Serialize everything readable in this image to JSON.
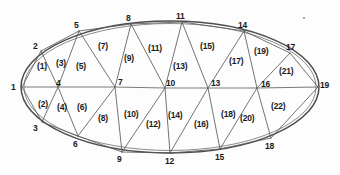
{
  "figure": {
    "type": "triangulated-ellipse-mesh",
    "caption": "",
    "stroke_color": "#5a5a5a",
    "background_color": "#fdfdfd",
    "canvas": {
      "width": 340,
      "height": 175
    }
  },
  "ellipse": {
    "center_x": 170,
    "center_y": 87,
    "radius_x": 149,
    "radius_y": 66
  },
  "nodes": [
    {
      "id": "1",
      "label": "1",
      "x": 22,
      "y": 87,
      "lx": 11,
      "ly": 83
    },
    {
      "id": "2",
      "label": "2",
      "x": 41,
      "y": 51,
      "lx": 33,
      "ly": 42
    },
    {
      "id": "3",
      "label": "3",
      "x": 42,
      "y": 122,
      "lx": 33,
      "ly": 124
    },
    {
      "id": "4",
      "label": "4",
      "x": 58,
      "y": 87,
      "lx": 56,
      "ly": 79
    },
    {
      "id": "5",
      "label": "5",
      "x": 79,
      "y": 31,
      "lx": 74,
      "ly": 21
    },
    {
      "id": "6",
      "label": "6",
      "x": 78,
      "y": 136,
      "lx": 73,
      "ly": 140
    },
    {
      "id": "7",
      "label": "7",
      "x": 115,
      "y": 87,
      "lx": 118,
      "ly": 78
    },
    {
      "id": "8",
      "label": "8",
      "x": 131,
      "y": 24,
      "lx": 126,
      "ly": 14
    },
    {
      "id": "9",
      "label": "9",
      "x": 122,
      "y": 152,
      "lx": 117,
      "ly": 155
    },
    {
      "id": "10",
      "label": "10",
      "x": 165,
      "y": 88,
      "lx": 166,
      "ly": 79
    },
    {
      "id": "11",
      "label": "11",
      "x": 182,
      "y": 22,
      "lx": 176,
      "ly": 12
    },
    {
      "id": "12",
      "label": "12",
      "x": 170,
      "y": 153,
      "lx": 165,
      "ly": 157
    },
    {
      "id": "13",
      "label": "13",
      "x": 208,
      "y": 88,
      "lx": 211,
      "ly": 79
    },
    {
      "id": "14",
      "label": "14",
      "x": 244,
      "y": 31,
      "lx": 238,
      "ly": 21
    },
    {
      "id": "15",
      "label": "15",
      "x": 220,
      "y": 149,
      "lx": 215,
      "ly": 153
    },
    {
      "id": "16",
      "label": "16",
      "x": 257,
      "y": 88,
      "lx": 261,
      "ly": 80
    },
    {
      "id": "17",
      "label": "17",
      "x": 290,
      "y": 53,
      "lx": 286,
      "ly": 43
    },
    {
      "id": "18",
      "label": "18",
      "x": 271,
      "y": 138,
      "lx": 265,
      "ly": 142
    },
    {
      "id": "19",
      "label": "19",
      "x": 318,
      "y": 87,
      "lx": 320,
      "ly": 81
    }
  ],
  "edges": [
    {
      "from": "1",
      "to": "2",
      "kind": "chord"
    },
    {
      "from": "1",
      "to": "3",
      "kind": "chord"
    },
    {
      "from": "1",
      "to": "4",
      "kind": "axis"
    },
    {
      "from": "2",
      "to": "4",
      "kind": "chord"
    },
    {
      "from": "3",
      "to": "4",
      "kind": "chord"
    },
    {
      "from": "2",
      "to": "5",
      "kind": "chord"
    },
    {
      "from": "4",
      "to": "5",
      "kind": "chord"
    },
    {
      "from": "3",
      "to": "6",
      "kind": "chord"
    },
    {
      "from": "4",
      "to": "6",
      "kind": "chord"
    },
    {
      "from": "4",
      "to": "7",
      "kind": "axis"
    },
    {
      "from": "5",
      "to": "7",
      "kind": "chord"
    },
    {
      "from": "6",
      "to": "7",
      "kind": "chord"
    },
    {
      "from": "5",
      "to": "8",
      "kind": "chord"
    },
    {
      "from": "7",
      "to": "8",
      "kind": "chord"
    },
    {
      "from": "6",
      "to": "9",
      "kind": "chord"
    },
    {
      "from": "7",
      "to": "9",
      "kind": "chord"
    },
    {
      "from": "7",
      "to": "10",
      "kind": "axis"
    },
    {
      "from": "8",
      "to": "10",
      "kind": "chord"
    },
    {
      "from": "9",
      "to": "10",
      "kind": "chord"
    },
    {
      "from": "8",
      "to": "11",
      "kind": "chord"
    },
    {
      "from": "10",
      "to": "11",
      "kind": "chord"
    },
    {
      "from": "9",
      "to": "12",
      "kind": "chord"
    },
    {
      "from": "10",
      "to": "12",
      "kind": "chord"
    },
    {
      "from": "10",
      "to": "13",
      "kind": "axis"
    },
    {
      "from": "11",
      "to": "13",
      "kind": "chord"
    },
    {
      "from": "12",
      "to": "13",
      "kind": "chord"
    },
    {
      "from": "11",
      "to": "14",
      "kind": "chord"
    },
    {
      "from": "13",
      "to": "14",
      "kind": "chord"
    },
    {
      "from": "12",
      "to": "15",
      "kind": "chord"
    },
    {
      "from": "13",
      "to": "15",
      "kind": "chord"
    },
    {
      "from": "13",
      "to": "16",
      "kind": "axis"
    },
    {
      "from": "14",
      "to": "16",
      "kind": "chord"
    },
    {
      "from": "15",
      "to": "16",
      "kind": "chord"
    },
    {
      "from": "14",
      "to": "17",
      "kind": "chord"
    },
    {
      "from": "16",
      "to": "17",
      "kind": "chord"
    },
    {
      "from": "15",
      "to": "18",
      "kind": "chord"
    },
    {
      "from": "16",
      "to": "18",
      "kind": "chord"
    },
    {
      "from": "16",
      "to": "19",
      "kind": "axis"
    },
    {
      "from": "17",
      "to": "19",
      "kind": "chord"
    },
    {
      "from": "18",
      "to": "19",
      "kind": "chord"
    }
  ],
  "triangles": [
    {
      "label": "(1)",
      "vertices": [
        "1",
        "2",
        "4"
      ],
      "lx": 37,
      "ly": 62
    },
    {
      "label": "(2)",
      "vertices": [
        "1",
        "3",
        "4"
      ],
      "lx": 38,
      "ly": 100
    },
    {
      "label": "(3)",
      "vertices": [
        "2",
        "4",
        "5"
      ],
      "lx": 56,
      "ly": 59
    },
    {
      "label": "(4)",
      "vertices": [
        "3",
        "4",
        "6"
      ],
      "lx": 57,
      "ly": 103
    },
    {
      "label": "(5)",
      "vertices": [
        "4",
        "5",
        "7"
      ],
      "lx": 76,
      "ly": 62
    },
    {
      "label": "(6)",
      "vertices": [
        "4",
        "6",
        "7"
      ],
      "lx": 77,
      "ly": 103
    },
    {
      "label": "(7)",
      "vertices": [
        "5",
        "7",
        "8"
      ],
      "lx": 98,
      "ly": 42
    },
    {
      "label": "(8)",
      "vertices": [
        "6",
        "7",
        "9"
      ],
      "lx": 98,
      "ly": 114
    },
    {
      "label": "(9)",
      "vertices": [
        "7",
        "8",
        "10"
      ],
      "lx": 124,
      "ly": 54
    },
    {
      "label": "(10)",
      "vertices": [
        "7",
        "9",
        "10"
      ],
      "lx": 124,
      "ly": 110
    },
    {
      "label": "(11)",
      "vertices": [
        "8",
        "10",
        "11"
      ],
      "lx": 148,
      "ly": 44
    },
    {
      "label": "(12)",
      "vertices": [
        "9",
        "10",
        "12"
      ],
      "lx": 146,
      "ly": 120
    },
    {
      "label": "(13)",
      "vertices": [
        "10",
        "11",
        "13"
      ],
      "lx": 173,
      "ly": 62
    },
    {
      "label": "(14)",
      "vertices": [
        "10",
        "12",
        "13"
      ],
      "lx": 168,
      "ly": 111
    },
    {
      "label": "(15)",
      "vertices": [
        "11",
        "13",
        "14"
      ],
      "lx": 200,
      "ly": 42
    },
    {
      "label": "(16)",
      "vertices": [
        "12",
        "13",
        "15"
      ],
      "lx": 194,
      "ly": 120
    },
    {
      "label": "(17)",
      "vertices": [
        "13",
        "14",
        "16"
      ],
      "lx": 229,
      "ly": 57
    },
    {
      "label": "(18)",
      "vertices": [
        "13",
        "15",
        "16"
      ],
      "lx": 221,
      "ly": 110
    },
    {
      "label": "(19)",
      "vertices": [
        "14",
        "16",
        "17"
      ],
      "lx": 254,
      "ly": 47
    },
    {
      "label": "(20)",
      "vertices": [
        "15",
        "16",
        "18"
      ],
      "lx": 240,
      "ly": 114
    },
    {
      "label": "(21)",
      "vertices": [
        "16",
        "17",
        "19"
      ],
      "lx": 279,
      "ly": 67
    },
    {
      "label": "(22)",
      "vertices": [
        "16",
        "18",
        "19"
      ],
      "lx": 271,
      "ly": 102
    }
  ],
  "artifacts": [
    {
      "name": "scan-speck",
      "x": 303,
      "y": 17
    }
  ]
}
